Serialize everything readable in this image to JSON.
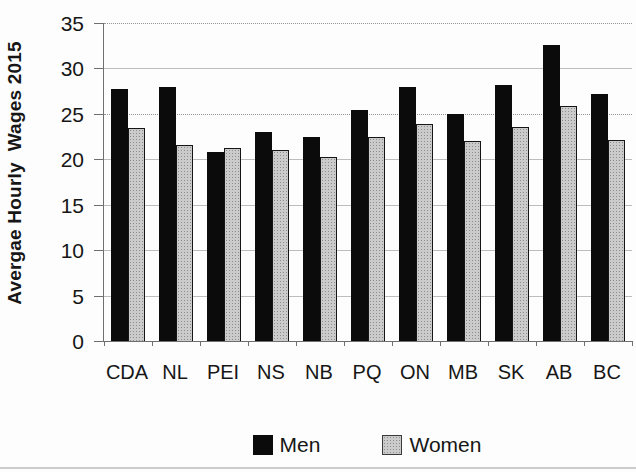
{
  "chart_data": {
    "type": "bar",
    "title": "",
    "categories": [
      "CDA",
      "NL",
      "PEI",
      "NS",
      "NB",
      "PQ",
      "ON",
      "MB",
      "SK",
      "AB",
      "BC"
    ],
    "series": [
      {
        "name": "Men",
        "color": "#0b0b0b",
        "pattern": "solid",
        "values": [
          27.7,
          28.0,
          20.8,
          23.0,
          22.5,
          25.4,
          28.0,
          25.0,
          28.2,
          32.6,
          27.2
        ]
      },
      {
        "name": "Women",
        "color": "#cbcbcb",
        "pattern": "dotted",
        "border_color": "#151515",
        "values": [
          23.4,
          21.6,
          21.2,
          21.0,
          20.3,
          22.4,
          23.9,
          22.0,
          23.6,
          25.9,
          22.1
        ]
      }
    ],
    "xlabel": "",
    "ylabel": "Avergae Hourly  Wages 2015",
    "ylim": [
      0,
      35
    ],
    "yticks": [
      0,
      5,
      10,
      15,
      20,
      25,
      30,
      35
    ],
    "grid": true,
    "legend_position": "bottom-center"
  },
  "colors": {
    "men_bar": "#0b0b0b",
    "women_bar_fill": "#cbcbcb",
    "women_bar_border": "#151515",
    "gridline": "#bdbdbd",
    "axis": "#6f6f6f",
    "background": "#fdfdfd"
  }
}
